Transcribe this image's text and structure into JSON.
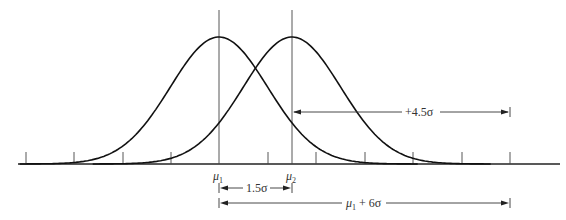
{
  "diagram": {
    "title": "",
    "type": "normal-distribution-shift",
    "sigma_px": 48.6,
    "baseline_y": 164,
    "axis": {
      "x_start": 18,
      "x_end": 560
    },
    "ticks_x": [
      26,
      74,
      123,
      171,
      268,
      316,
      365,
      413,
      462,
      510
    ],
    "means": [
      {
        "id": "mu1",
        "x": 219,
        "label_main": "μ",
        "label_sub": "1"
      },
      {
        "id": "mu2",
        "x": 292,
        "label_main": "μ",
        "label_sub": "2"
      }
    ],
    "curves": [
      {
        "id": "curve-1",
        "mean_x": 219,
        "peak_y": 37
      },
      {
        "id": "curve-2",
        "mean_x": 292,
        "peak_y": 37
      }
    ],
    "dimensions": [
      {
        "id": "plus-4-5-sigma",
        "label": "+4.5σ",
        "x1": 292,
        "x2": 510,
        "y": 112
      },
      {
        "id": "one-point-five-sigma",
        "label": "1.5σ",
        "x1": 219,
        "x2": 292,
        "y": 188
      },
      {
        "id": "mu1-plus-6-sigma",
        "label_main": "μ",
        "label_sub": "1",
        "label_rest": " + 6σ",
        "x1": 219,
        "x2": 510,
        "y": 203
      }
    ]
  }
}
